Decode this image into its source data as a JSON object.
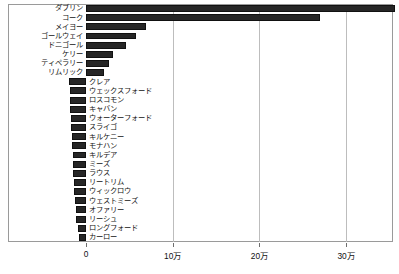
{
  "chart_data": {
    "type": "bar",
    "orientation": "horizontal",
    "title": "",
    "xlabel": "",
    "ylabel": "",
    "xlim": [
      0,
      355000
    ],
    "grid": true,
    "legend": false,
    "xticks": [
      {
        "value": 0,
        "label": "0"
      },
      {
        "value": 100000,
        "label": "10万"
      },
      {
        "value": 200000,
        "label": "20万"
      },
      {
        "value": 300000,
        "label": "30万"
      }
    ],
    "categories": [
      "ダブリン",
      "コーク",
      "メイヨー",
      "ゴールウェイ",
      "ドニゴール",
      "ケリー",
      "ティペラリー",
      "リムリック",
      "クレア",
      "ウェックスフォード",
      "ロスコモン",
      "キャバン",
      "ウォーターフォード",
      "スライゴ",
      "キルケニー",
      "モナハン",
      "キルデア",
      "ミーズ",
      "ラウス",
      "リートリム",
      "ウィックロウ",
      "ウェストミーズ",
      "オファリー",
      "リーシュ",
      "ロングフォード",
      "カーロー"
    ],
    "values": [
      356000,
      270000,
      69000,
      58000,
      46000,
      31000,
      27000,
      21000,
      19500,
      19000,
      18500,
      18000,
      17500,
      17000,
      16500,
      16000,
      15500,
      15000,
      14500,
      14000,
      13500,
      13000,
      12000,
      11000,
      9500,
      8000
    ],
    "label_side": [
      "left",
      "left",
      "left",
      "left",
      "left",
      "left",
      "left",
      "left",
      "right",
      "right",
      "right",
      "right",
      "right",
      "right",
      "right",
      "right",
      "right",
      "right",
      "right",
      "right",
      "right",
      "right",
      "right",
      "right",
      "right",
      "right"
    ]
  },
  "colors": {
    "bar": "#262626",
    "grid": "#bdbdbd",
    "frame": "#9a9a9a",
    "text": "#111111"
  }
}
